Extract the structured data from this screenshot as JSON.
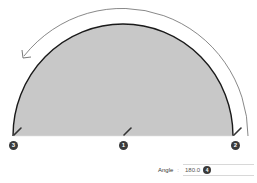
{
  "diagram": {
    "shape": "semicircle",
    "fill_color": "#c8c8c8",
    "stroke_color": "#1a1a1a",
    "arrow_color": "#555555",
    "arrow_direction": "counter-clockwise",
    "points": [
      {
        "id": "center",
        "badge": "1"
      },
      {
        "id": "start",
        "badge": "2"
      },
      {
        "id": "end",
        "badge": "3"
      }
    ]
  },
  "angle_field": {
    "label": "Angle",
    "value": "180.0",
    "badge": "4"
  }
}
